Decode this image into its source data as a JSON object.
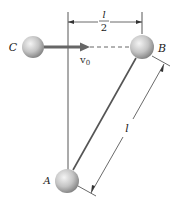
{
  "diagram": {
    "balls": {
      "A": {
        "label": "A"
      },
      "B": {
        "label": "B"
      },
      "C": {
        "label": "C"
      }
    },
    "velocity": {
      "symbol": "v",
      "subscript": "0"
    },
    "dimensions": {
      "half_length": {
        "numerator": "l",
        "denominator": "2"
      },
      "rod_length": {
        "label": "l"
      }
    },
    "colors": {
      "ball_light": "#f0f0f0",
      "ball_dark": "#8a8a8a",
      "line": "#333333",
      "arrow": "#666666"
    }
  }
}
